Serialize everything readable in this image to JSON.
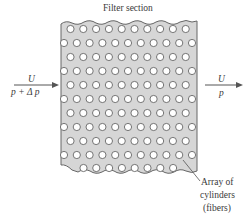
{
  "title": "Filter section",
  "inlet": {
    "velocity_label": "U",
    "pressure_label": "p + Δ p"
  },
  "outlet": {
    "velocity_label": "U",
    "pressure_label": "p"
  },
  "callout": {
    "line1": "Array of",
    "line2": "cylinders",
    "line3": "(fibers)"
  },
  "colors": {
    "filter_fill": "#d6d6d6",
    "filter_border": "#666666",
    "cylinder_fill": "#ffffff",
    "cylinder_stroke": "#666666",
    "text": "#3a3a3a",
    "arrow": "#555555"
  },
  "grid": {
    "rows": 11,
    "odd_row_count": 10,
    "even_row_count": 11,
    "spacing_x": 12.8,
    "spacing_y": 14
  }
}
